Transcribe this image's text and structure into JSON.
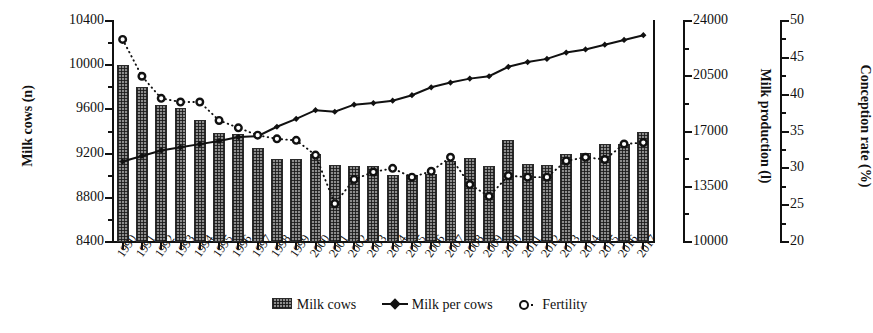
{
  "chart_data": {
    "type": "bar",
    "title": "",
    "xlabel": "",
    "grid": false,
    "legend_position": "bottom",
    "categories": [
      "1990",
      "1991",
      "1992",
      "1993",
      "1994",
      "1995",
      "1996",
      "1997",
      "1998",
      "1999",
      "2000",
      "2001",
      "2002",
      "2003",
      "2004",
      "2005",
      "2006",
      "2007",
      "2008",
      "2009",
      "2010",
      "2011",
      "2012",
      "2013",
      "2014",
      "2015",
      "2016",
      "2017"
    ],
    "axes": {
      "left": {
        "label": "Milk cows (n)",
        "ticks": [
          "8400",
          "8800",
          "9200",
          "9600",
          "10000",
          "10400"
        ],
        "min": 8400,
        "max": 10400,
        "step": 400
      },
      "middle": {
        "label": "Milk production (l)",
        "ticks": [
          "10000",
          "13500",
          "17000",
          "20500",
          "24000"
        ],
        "min": 10000,
        "max": 24000,
        "step": 3500
      },
      "right": {
        "label": "Conception rate (%)",
        "ticks": [
          "20",
          "25",
          "30",
          "35",
          "40",
          "45",
          "50"
        ],
        "min": 20,
        "max": 50,
        "step": 5
      }
    },
    "series": [
      {
        "name": "Milk cows",
        "marker": "bar",
        "axis": "left",
        "unit": "n",
        "values": [
          10000,
          9800,
          9640,
          9615,
          9500,
          9390,
          9380,
          9250,
          9155,
          9150,
          9200,
          9095,
          9090,
          9085,
          9010,
          9010,
          9020,
          9130,
          9160,
          9085,
          9320,
          9110,
          9100,
          9200,
          9205,
          9290,
          9290,
          9400
        ]
      },
      {
        "name": "Milk per cows",
        "marker": "filled-diamond-line",
        "axis": "middle",
        "unit": "l",
        "values": [
          15100,
          15450,
          15800,
          16000,
          16200,
          16400,
          16650,
          16700,
          17300,
          17800,
          18350,
          18250,
          18700,
          18800,
          18950,
          19300,
          19800,
          20100,
          20350,
          20500,
          21100,
          21400,
          21600,
          22000,
          22200,
          22500,
          22800,
          23100
        ]
      },
      {
        "name": "Fertility",
        "marker": "open-circle-dotted",
        "axis": "right",
        "unit": "%",
        "values": [
          47.5,
          42.5,
          39.5,
          39.0,
          39.0,
          36.5,
          35.5,
          34.5,
          34.0,
          33.8,
          31.8,
          25.2,
          28.5,
          29.5,
          30.0,
          28.8,
          29.6,
          31.5,
          27.8,
          26.2,
          29.0,
          28.8,
          28.8,
          31.0,
          31.5,
          31.2,
          33.3,
          33.5
        ]
      }
    ]
  },
  "legend": {
    "items": [
      {
        "label": "Milk cows",
        "marker": "bar-swatch"
      },
      {
        "label": "Milk per cows",
        "marker": "line-diamond-swatch"
      },
      {
        "label": "Fertility",
        "marker": "dotted-circle-swatch"
      }
    ]
  },
  "colors": {
    "ink": "#111111",
    "bar_fill": "#8d8d8d",
    "background": "#ffffff"
  }
}
